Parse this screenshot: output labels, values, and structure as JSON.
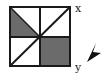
{
  "diagram": {
    "labels": {
      "x": "x",
      "y": "y"
    },
    "colors": {
      "stroke": "#1a1a1a",
      "shade": "#6b6b6b",
      "background": "#ffffff"
    },
    "square": {
      "left": 10,
      "top": 6,
      "size": 60
    },
    "shaded_regions": [
      "top-left quadrant lower triangle",
      "bottom-right quadrant"
    ],
    "arrow": {
      "direction": "down-left"
    }
  }
}
